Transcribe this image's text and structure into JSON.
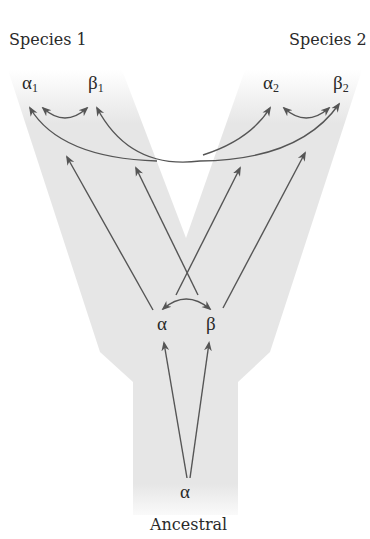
{
  "labels": {
    "species1": "Species 1",
    "species2": "Species 2",
    "ancestral": "Ancestral"
  },
  "genes": {
    "alpha_symbol": "α",
    "beta_symbol": "β",
    "species1_alpha_sub": "1",
    "species1_beta_sub": "1",
    "species2_alpha_sub": "2",
    "species2_beta_sub": "2"
  },
  "colors": {
    "background": "#ffffff",
    "tree_fill": "#e6e6e6",
    "arrow": "#555555",
    "text": "#2a2a2a"
  }
}
